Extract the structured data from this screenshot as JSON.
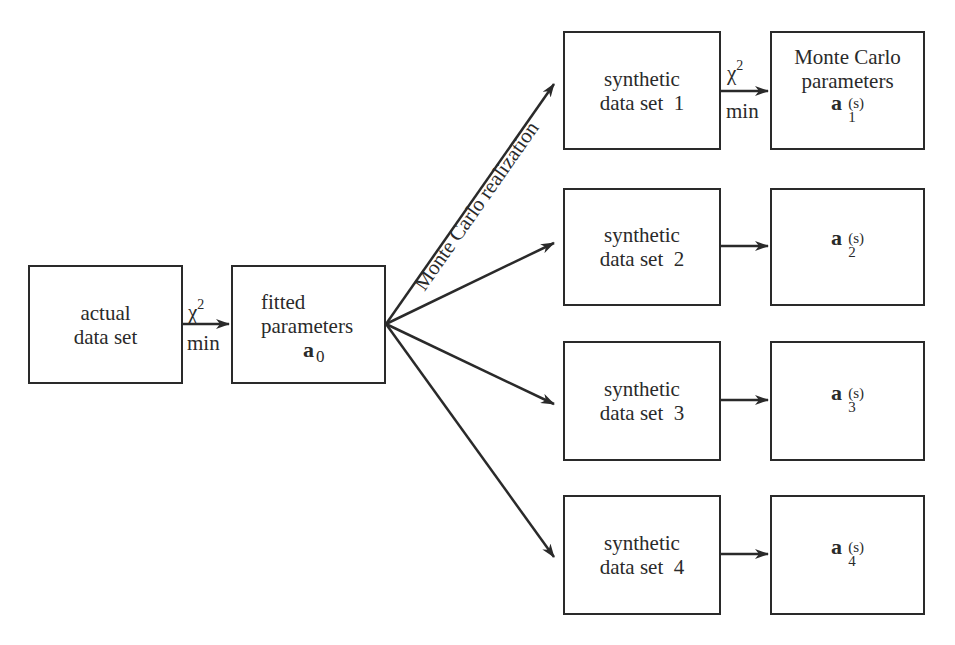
{
  "diagram": {
    "actual": {
      "line1": "actual",
      "line2": "data set"
    },
    "fitted": {
      "line1": "fitted",
      "line2": "parameters",
      "vector": "a",
      "subscript": "0"
    },
    "chi_label": {
      "symbol": "χ",
      "exponent": "2",
      "below": "min"
    },
    "realization_label": "Monte Carlo realization",
    "synthetic": [
      {
        "line1": "synthetic",
        "line2": "data set  1"
      },
      {
        "line1": "synthetic",
        "line2": "data set  2"
      },
      {
        "line1": "synthetic",
        "line2": "data set  3"
      },
      {
        "line1": "synthetic",
        "line2": "data set  4"
      }
    ],
    "results": [
      {
        "title1": "Monte Carlo",
        "title2": "parameters",
        "vector": "a",
        "sup": "(s)",
        "sub": "1"
      },
      {
        "vector": "a",
        "sup": "(s)",
        "sub": "2"
      },
      {
        "vector": "a",
        "sup": "(s)",
        "sub": "3"
      },
      {
        "vector": "a",
        "sup": "(s)",
        "sub": "4"
      }
    ],
    "colors": {
      "ink": "#2a2a2a",
      "background": "#ffffff"
    }
  }
}
